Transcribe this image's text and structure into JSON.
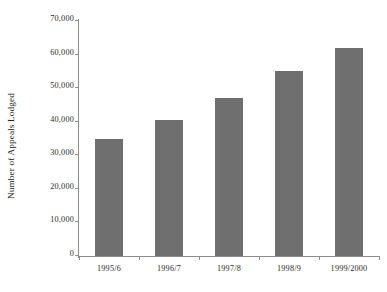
{
  "chart_data": {
    "type": "bar",
    "title": "",
    "xlabel": "",
    "ylabel": "Number of Appeals Lodged",
    "categories": [
      "1995/6",
      "1996/7",
      "1997/8",
      "1998/9",
      "1999/2000"
    ],
    "values": [
      35000,
      40500,
      47000,
      55000,
      62000
    ],
    "ylim": [
      0,
      70000
    ],
    "ytick_values": [
      0,
      10000,
      20000,
      30000,
      40000,
      50000,
      60000,
      70000
    ],
    "ytick_labels": [
      "0",
      "10,000",
      "20,000",
      "30,000",
      "40,000",
      "50,000",
      "60,000",
      "70,000"
    ],
    "grid": false,
    "legend": null,
    "bar_color": "#6f6f6f",
    "axis_color": "#8d8d8d",
    "background_color": "#ffffff"
  }
}
